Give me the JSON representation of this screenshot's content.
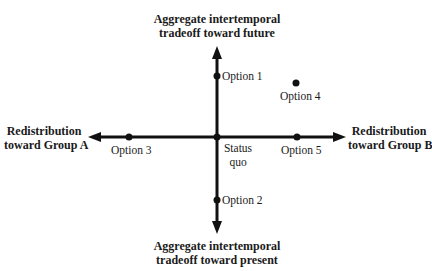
{
  "diagram": {
    "axes": {
      "top_label_line1": "Aggregate intertemporal",
      "top_label_line2": "tradeoff toward future",
      "bottom_label_line1": "Aggregate intertemporal",
      "bottom_label_line2": "tradeoff toward present",
      "left_label_line1": "Redistribution",
      "left_label_line2": "toward Group A",
      "right_label_line1": "Redistribution",
      "right_label_line2": "toward Group B"
    },
    "points": [
      {
        "label": "Option 1"
      },
      {
        "label": "Option 2"
      },
      {
        "label": "Option 3"
      },
      {
        "label": "Option 4"
      },
      {
        "label": "Option 5"
      },
      {
        "label_line1": "Status",
        "label_line2": "quo"
      }
    ],
    "colors": {
      "ink": "#111111",
      "background": "#ffffff"
    }
  }
}
